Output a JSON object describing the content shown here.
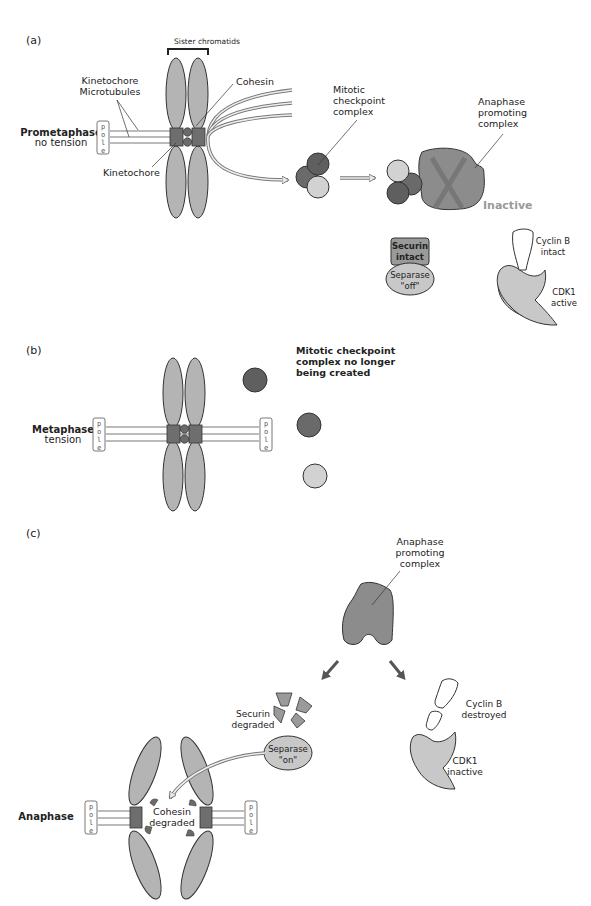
{
  "figure": {
    "panels": [
      {
        "id": "a",
        "label": "(a)",
        "stage_label": "Prometaphase",
        "stage_sublabel": "no tension",
        "pole_label": "p o l e",
        "annotations": {
          "sister_chromatids": "Sister chromatids",
          "kinetochore_microtubules_line1": "Kinetochore",
          "kinetochore_microtubules_line2": "Microtubules",
          "cohesin": "Cohesin",
          "kinetochore": "Kinetochore",
          "mcc_line1": "Mitotic",
          "mcc_line2": "checkpoint",
          "mcc_line3": "complex",
          "apc_line1": "Anaphase",
          "apc_line2": "promoting",
          "apc_line3": "complex",
          "apc_state": "Inactive",
          "securin_line1": "Securin",
          "securin_line2": "intact",
          "separase_line1": "Separase",
          "separase_line2": "\"off\"",
          "cyclin_line1": "Cyclin B",
          "cyclin_line2": "intact",
          "cdk_line1": "CDK1",
          "cdk_line2": "active"
        }
      },
      {
        "id": "b",
        "label": "(b)",
        "stage_label": "Metaphase",
        "stage_sublabel": "tension",
        "pole_label": "p o l e",
        "annotations": {
          "mcc_line1": "Mitotic checkpoint",
          "mcc_line2": "complex no longer",
          "mcc_line3": "being created"
        }
      },
      {
        "id": "c",
        "label": "(c)",
        "stage_label": "Anaphase",
        "pole_label": "p o l e",
        "annotations": {
          "apc_line1": "Anaphase",
          "apc_line2": "promoting",
          "apc_line3": "complex",
          "securin_line1": "Securin",
          "securin_line2": "degraded",
          "separase_line1": "Separase",
          "separase_line2": "\"on\"",
          "cyclin_line1": "Cyclin B",
          "cyclin_line2": "destroyed",
          "cdk_line1": "CDK1",
          "cdk_line2": "inactive",
          "cohesin_line1": "Cohesin",
          "cohesin_line2": "degraded"
        }
      }
    ],
    "colors": {
      "chromatid": "#b4b4b4",
      "kinetochore": "#6e6e6e",
      "dark_protein": "#5f5f5f",
      "mid_protein": "#7a7a7a",
      "light_protein": "#d2d2d2",
      "apc": "#8c8c8c",
      "inactive_text": "#9a9a9a",
      "outline": "#333333"
    }
  }
}
